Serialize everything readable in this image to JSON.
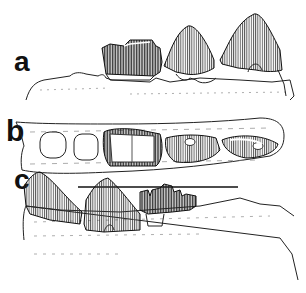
{
  "figure": {
    "panels": [
      {
        "label": "a",
        "view": "lateral view of jaw fragment with teeth"
      },
      {
        "label": "b",
        "view": "occlusal view of jaw fragment with alveoli and teeth"
      },
      {
        "label": "c",
        "view": "medial view of jaw fragment with teeth"
      }
    ],
    "scale_bar": {
      "present": true,
      "unit_label": ""
    },
    "colors": {
      "ink": "#111111",
      "background": "#ffffff",
      "hatch": "#333333"
    }
  }
}
